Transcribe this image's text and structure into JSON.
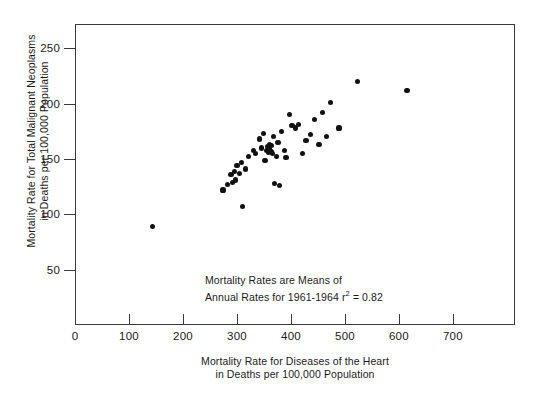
{
  "chart_data": {
    "type": "scatter",
    "title": "",
    "xlabel": "Mortality Rate for Diseases of the Heart in Deaths per 100,000 Population",
    "ylabel": "Mortality Rate for Total Malignant Neoplasms in Deaths per 100,000 Population",
    "xlim": [
      0,
      815
    ],
    "ylim": [
      0,
      272
    ],
    "grid": false,
    "legend": null,
    "xticks": [
      0,
      100,
      200,
      300,
      400,
      500,
      600,
      700
    ],
    "yticks": [
      50,
      100,
      150,
      200,
      250
    ],
    "r_squared": 0.82,
    "n_points": 50,
    "points": [
      {
        "x": 143,
        "y": 89
      },
      {
        "x": 274,
        "y": 122
      },
      {
        "x": 283,
        "y": 127
      },
      {
        "x": 289,
        "y": 136
      },
      {
        "x": 292,
        "y": 129
      },
      {
        "x": 296,
        "y": 139
      },
      {
        "x": 298,
        "y": 131
      },
      {
        "x": 300,
        "y": 144
      },
      {
        "x": 304,
        "y": 137
      },
      {
        "x": 309,
        "y": 147
      },
      {
        "x": 311,
        "y": 107
      },
      {
        "x": 316,
        "y": 141
      },
      {
        "x": 322,
        "y": 152
      },
      {
        "x": 330,
        "y": 158
      },
      {
        "x": 334,
        "y": 155
      },
      {
        "x": 341,
        "y": 168
      },
      {
        "x": 346,
        "y": 160
      },
      {
        "x": 349,
        "y": 173
      },
      {
        "x": 352,
        "y": 149
      },
      {
        "x": 354,
        "y": 158
      },
      {
        "x": 356,
        "y": 161
      },
      {
        "x": 358,
        "y": 156
      },
      {
        "x": 360,
        "y": 163
      },
      {
        "x": 361,
        "y": 159
      },
      {
        "x": 363,
        "y": 157
      },
      {
        "x": 364,
        "y": 162
      },
      {
        "x": 366,
        "y": 155
      },
      {
        "x": 368,
        "y": 170
      },
      {
        "x": 370,
        "y": 128
      },
      {
        "x": 373,
        "y": 152
      },
      {
        "x": 376,
        "y": 165
      },
      {
        "x": 379,
        "y": 126
      },
      {
        "x": 382,
        "y": 175
      },
      {
        "x": 388,
        "y": 158
      },
      {
        "x": 391,
        "y": 151
      },
      {
        "x": 398,
        "y": 190
      },
      {
        "x": 402,
        "y": 180
      },
      {
        "x": 409,
        "y": 178
      },
      {
        "x": 414,
        "y": 181
      },
      {
        "x": 421,
        "y": 155
      },
      {
        "x": 428,
        "y": 167
      },
      {
        "x": 436,
        "y": 172
      },
      {
        "x": 443,
        "y": 186
      },
      {
        "x": 452,
        "y": 163
      },
      {
        "x": 459,
        "y": 192
      },
      {
        "x": 466,
        "y": 170
      },
      {
        "x": 474,
        "y": 201
      },
      {
        "x": 489,
        "y": 178
      },
      {
        "x": 524,
        "y": 220
      },
      {
        "x": 615,
        "y": 212
      }
    ]
  },
  "axes": {
    "x_title_line1": "Mortality Rate for Diseases of the Heart",
    "x_title_line2": "in Deaths per 100,000 Population",
    "y_title_line1": "Mortality Rate for Total Malignant Neoplasms",
    "y_title_line2": "in Deaths per 100,000 Population",
    "x_tick_labels": [
      "0",
      "100",
      "200",
      "300",
      "400",
      "500",
      "600",
      "700"
    ],
    "y_tick_labels": [
      "50",
      "100",
      "150",
      "200",
      "250"
    ]
  },
  "annotation": {
    "line1": "Mortality Rates are Means of",
    "line2_prefix": "Annual Rates for 1961-1964 r",
    "line2_sup": "2",
    "line2_suffix": "= 0.82"
  },
  "style": {
    "point_color": "#111111",
    "axis_color": "#3a3a3a",
    "text_color": "#1a1a1a",
    "background": "#ffffff"
  }
}
